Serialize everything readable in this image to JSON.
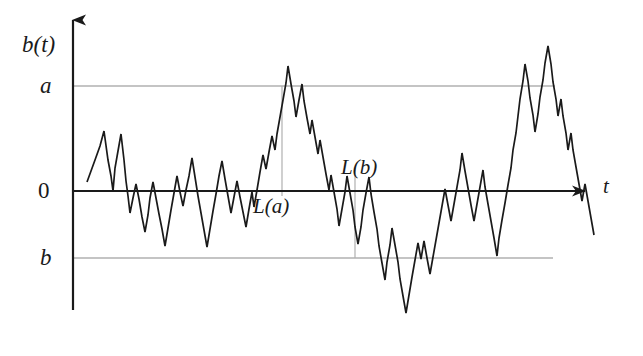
{
  "figure": {
    "background_color": "#ffffff",
    "width": 643,
    "height": 356
  },
  "labels": {
    "y_axis": "b(t)",
    "x_axis": "t",
    "level_a": "a",
    "level_zero": "0",
    "level_b": "b",
    "crossing_a": "L(a)",
    "crossing_b": "L(b)"
  },
  "colors": {
    "path": "#1a1a1a",
    "axis": "#1a1a1a",
    "level_line": "#8a8a8a",
    "crossing_line": "#b0b0b0",
    "text": "#1a1a1a"
  },
  "chart_data": {
    "type": "line",
    "title": "b(t)",
    "xlabel": "t",
    "ylabel": "b(t)",
    "grid": false,
    "legend": "none",
    "axis_geometry": {
      "y_axis_x": 73,
      "y_axis_top": 14,
      "y_axis_bottom": 310,
      "x_axis_y": 191,
      "x_axis_left": 73,
      "x_axis_right": 592
    },
    "levels": [
      {
        "name": "a",
        "y_pixel": 86,
        "x_start": 73,
        "x_end": 555,
        "color": "#8a8a8a"
      },
      {
        "name": "0",
        "y_pixel": 191,
        "x_start": 73,
        "x_end": 592,
        "color": "#1a1a1a"
      },
      {
        "name": "b",
        "y_pixel": 258,
        "x_start": 73,
        "x_end": 553,
        "color": "#8a8a8a"
      }
    ],
    "crossing_markers": [
      {
        "name": "L(a)",
        "x_pixel": 282,
        "y_top": 86,
        "y_bottom": 196,
        "color": "#b0b0b0"
      },
      {
        "name": "L(b)",
        "x_pixel": 355,
        "y_top": 168,
        "y_bottom": 258,
        "color": "#b0b0b0"
      }
    ],
    "ylim_pixels": [
      14,
      340
    ],
    "xlim_pixels": [
      73,
      592
    ],
    "series": [
      {
        "name": "random walk path",
        "color": "#1a1a1a",
        "points": [
          [
            87,
            182
          ],
          [
            95,
            160
          ],
          [
            100,
            146
          ],
          [
            104,
            131
          ],
          [
            108,
            160
          ],
          [
            111,
            176
          ],
          [
            113,
            191
          ],
          [
            115,
            168
          ],
          [
            118,
            151
          ],
          [
            121,
            134
          ],
          [
            124,
            160
          ],
          [
            126,
            181
          ],
          [
            128,
            196
          ],
          [
            130,
            213
          ],
          [
            133,
            198
          ],
          [
            136,
            184
          ],
          [
            139,
            199
          ],
          [
            142,
            217
          ],
          [
            145,
            232
          ],
          [
            148,
            215
          ],
          [
            150,
            198
          ],
          [
            153,
            182
          ],
          [
            156,
            198
          ],
          [
            159,
            214
          ],
          [
            162,
            229
          ],
          [
            165,
            246
          ],
          [
            168,
            228
          ],
          [
            171,
            210
          ],
          [
            174,
            193
          ],
          [
            177,
            176
          ],
          [
            180,
            192
          ],
          [
            183,
            206
          ],
          [
            186,
            190
          ],
          [
            189,
            176
          ],
          [
            192,
            158
          ],
          [
            195,
            177
          ],
          [
            198,
            196
          ],
          [
            201,
            213
          ],
          [
            204,
            230
          ],
          [
            207,
            247
          ],
          [
            210,
            229
          ],
          [
            213,
            211
          ],
          [
            216,
            194
          ],
          [
            219,
            176
          ],
          [
            222,
            161
          ],
          [
            225,
            179
          ],
          [
            228,
            196
          ],
          [
            231,
            213
          ],
          [
            234,
            197
          ],
          [
            237,
            181
          ],
          [
            240,
            197
          ],
          [
            243,
            212
          ],
          [
            246,
            227
          ],
          [
            249,
            209
          ],
          [
            252,
            192
          ],
          [
            254,
            207
          ],
          [
            257,
            190
          ],
          [
            260,
            172
          ],
          [
            263,
            155
          ],
          [
            266,
            169
          ],
          [
            269,
            152
          ],
          [
            272,
            136
          ],
          [
            275,
            150
          ],
          [
            277,
            134
          ],
          [
            280,
            117
          ],
          [
            283,
            100
          ],
          [
            286,
            83
          ],
          [
            288,
            66
          ],
          [
            291,
            84
          ],
          [
            294,
            101
          ],
          [
            296,
            117
          ],
          [
            299,
            100
          ],
          [
            302,
            84
          ],
          [
            304,
            101
          ],
          [
            307,
            118
          ],
          [
            310,
            134
          ],
          [
            312,
            120
          ],
          [
            315,
            137
          ],
          [
            318,
            154
          ],
          [
            320,
            140
          ],
          [
            323,
            157
          ],
          [
            326,
            174
          ],
          [
            329,
            190
          ],
          [
            331,
            175
          ],
          [
            334,
            192
          ],
          [
            337,
            209
          ],
          [
            339,
            226
          ],
          [
            342,
            209
          ],
          [
            345,
            192
          ],
          [
            347,
            176
          ],
          [
            350,
            193
          ],
          [
            353,
            210
          ],
          [
            355,
            227
          ],
          [
            358,
            244
          ],
          [
            361,
            227
          ],
          [
            363,
            210
          ],
          [
            366,
            193
          ],
          [
            369,
            177
          ],
          [
            371,
            194
          ],
          [
            374,
            212
          ],
          [
            377,
            229
          ],
          [
            379,
            246
          ],
          [
            382,
            263
          ],
          [
            385,
            280
          ],
          [
            387,
            262
          ],
          [
            390,
            245
          ],
          [
            392,
            228
          ],
          [
            395,
            245
          ],
          [
            398,
            262
          ],
          [
            400,
            279
          ],
          [
            403,
            296
          ],
          [
            406,
            313
          ],
          [
            409,
            295
          ],
          [
            412,
            277
          ],
          [
            415,
            260
          ],
          [
            418,
            243
          ],
          [
            421,
            259
          ],
          [
            424,
            241
          ],
          [
            427,
            258
          ],
          [
            430,
            274
          ],
          [
            433,
            257
          ],
          [
            436,
            240
          ],
          [
            439,
            223
          ],
          [
            442,
            206
          ],
          [
            445,
            189
          ],
          [
            448,
            205
          ],
          [
            451,
            221
          ],
          [
            454,
            204
          ],
          [
            457,
            187
          ],
          [
            460,
            170
          ],
          [
            462,
            153
          ],
          [
            465,
            171
          ],
          [
            468,
            188
          ],
          [
            471,
            205
          ],
          [
            474,
            221
          ],
          [
            477,
            204
          ],
          [
            480,
            187
          ],
          [
            483,
            170
          ],
          [
            485,
            187
          ],
          [
            488,
            204
          ],
          [
            491,
            221
          ],
          [
            494,
            238
          ],
          [
            497,
            256
          ],
          [
            499,
            238
          ],
          [
            502,
            220
          ],
          [
            505,
            203
          ],
          [
            508,
            185
          ],
          [
            511,
            168
          ],
          [
            513,
            150
          ],
          [
            516,
            133
          ],
          [
            518,
            116
          ],
          [
            520,
            99
          ],
          [
            523,
            81
          ],
          [
            525,
            64
          ],
          [
            528,
            81
          ],
          [
            530,
            98
          ],
          [
            533,
            115
          ],
          [
            535,
            132
          ],
          [
            538,
            114
          ],
          [
            540,
            97
          ],
          [
            543,
            80
          ],
          [
            545,
            63
          ],
          [
            548,
            46
          ],
          [
            551,
            64
          ],
          [
            553,
            82
          ],
          [
            556,
            99
          ],
          [
            558,
            116
          ],
          [
            561,
            99
          ],
          [
            563,
            116
          ],
          [
            566,
            133
          ],
          [
            568,
            150
          ],
          [
            571,
            133
          ],
          [
            573,
            150
          ],
          [
            576,
            167
          ],
          [
            579,
            184
          ],
          [
            582,
            201
          ],
          [
            585,
            184
          ],
          [
            588,
            201
          ],
          [
            591,
            218
          ],
          [
            594,
            235
          ]
        ]
      }
    ]
  }
}
